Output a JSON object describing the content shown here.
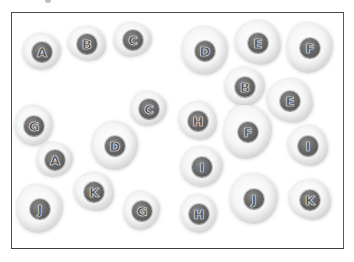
{
  "game": {
    "type": "memory-matching",
    "board": {
      "x": 11,
      "y": 12,
      "width": 333,
      "height": 237
    },
    "colors": {
      "frame": "#4a4a4a",
      "background": "#ffffff",
      "tile": "#f2f2f2",
      "badge": "#646464",
      "letter": "#4e4e4e"
    },
    "tiles": [
      {
        "letter": "A",
        "x": 42,
        "y": 52,
        "w": 38,
        "h": 36
      },
      {
        "letter": "B",
        "x": 87,
        "y": 44,
        "w": 38,
        "h": 34
      },
      {
        "letter": "C",
        "x": 133,
        "y": 40,
        "w": 38,
        "h": 34
      },
      {
        "letter": "D",
        "x": 205,
        "y": 51,
        "w": 46,
        "h": 48
      },
      {
        "letter": "E",
        "x": 258,
        "y": 43,
        "w": 46,
        "h": 44
      },
      {
        "letter": "F",
        "x": 310,
        "y": 48,
        "w": 46,
        "h": 50
      },
      {
        "letter": "B",
        "x": 245,
        "y": 87,
        "w": 40,
        "h": 38
      },
      {
        "letter": "E",
        "x": 290,
        "y": 101,
        "w": 46,
        "h": 44
      },
      {
        "letter": "C",
        "x": 149,
        "y": 109,
        "w": 36,
        "h": 34
      },
      {
        "letter": "G",
        "x": 34,
        "y": 126,
        "w": 38,
        "h": 40
      },
      {
        "letter": "H",
        "x": 198,
        "y": 121,
        "w": 38,
        "h": 38
      },
      {
        "letter": "F",
        "x": 248,
        "y": 132,
        "w": 48,
        "h": 54
      },
      {
        "letter": "D",
        "x": 115,
        "y": 146,
        "w": 46,
        "h": 48
      },
      {
        "letter": "I",
        "x": 308,
        "y": 146,
        "w": 40,
        "h": 40
      },
      {
        "letter": "A",
        "x": 55,
        "y": 160,
        "w": 36,
        "h": 34
      },
      {
        "letter": "I",
        "x": 202,
        "y": 167,
        "w": 42,
        "h": 40
      },
      {
        "letter": "K",
        "x": 94,
        "y": 192,
        "w": 40,
        "h": 38
      },
      {
        "letter": "J",
        "x": 40,
        "y": 209,
        "w": 46,
        "h": 48
      },
      {
        "letter": "J",
        "x": 254,
        "y": 199,
        "w": 48,
        "h": 50
      },
      {
        "letter": "K",
        "x": 310,
        "y": 200,
        "w": 42,
        "h": 40
      },
      {
        "letter": "G",
        "x": 142,
        "y": 211,
        "w": 36,
        "h": 38
      },
      {
        "letter": "H",
        "x": 199,
        "y": 214,
        "w": 36,
        "h": 38
      }
    ]
  }
}
